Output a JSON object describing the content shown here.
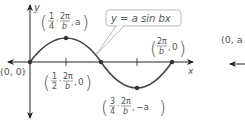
{
  "diagram": {
    "function_label": "y = a sin bx",
    "axes": {
      "x_label": "x",
      "y_label": "y"
    },
    "points": [
      {
        "name": "origin",
        "label": "(0, 0)"
      },
      {
        "name": "max",
        "frac": "1/4",
        "label": "(1/4 · 2π/b, a)"
      },
      {
        "name": "zero",
        "frac": "1/2",
        "label": "(1/2 · 2π/b, 0)"
      },
      {
        "name": "min",
        "frac": "3/4",
        "label": "(3/4 · 2π/b, −a)"
      },
      {
        "name": "end",
        "label": "(2π/b, 0)"
      }
    ],
    "right_partial_label": "(0, a",
    "colors": {
      "curve": "#444444",
      "axis": "#222222",
      "text": "#555555",
      "callout_border": "#aaaaaa"
    }
  },
  "text": {
    "y_label": "y",
    "x_label": "x",
    "origin": "(0, 0)",
    "callout": "y = a sin bx",
    "one": "1",
    "two": "2",
    "three": "3",
    "four": "4",
    "twopi": "2π",
    "b": "b",
    "a": "a",
    "neg_a": "−a",
    "zero": "0",
    "dot": "·",
    "comma": ",",
    "right_partial": "(0, a"
  }
}
